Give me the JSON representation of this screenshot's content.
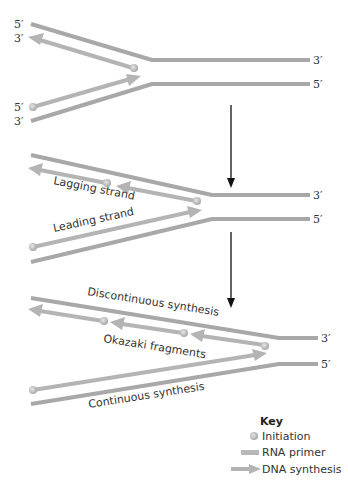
{
  "figure": {
    "panels": [
      {
        "id": "initiation",
        "labels": {
          "top_left_5": "5′",
          "top_left_3": "3′",
          "bottom_left_5": "5′",
          "bottom_left_3": "3′",
          "right_top": "3′",
          "right_bottom": "5′"
        }
      },
      {
        "id": "elongation",
        "labels": {
          "lagging": "Lagging strand",
          "leading": "Leading strand",
          "right_top": "3′",
          "right_bottom": "5′"
        }
      },
      {
        "id": "fragments",
        "labels": {
          "discontinuous": "Discontinuous synthesis",
          "okazaki": "Okazaki fragments",
          "continuous": "Continuous synthesis",
          "right_top": "3′",
          "right_bottom": "5′"
        }
      }
    ],
    "key": {
      "title": "Key",
      "items": [
        {
          "icon": "initiation-dot-icon",
          "label": "Initiation"
        },
        {
          "icon": "rna-primer-bar-icon",
          "label": "RNA primer"
        },
        {
          "icon": "dna-synthesis-arrow-icon",
          "label": "DNA synthesis"
        }
      ]
    },
    "colors": {
      "strand": "#a9a9a9",
      "strand_dark": "#8f8f8f",
      "primer": "#bdbdbd",
      "dot": "#c8c8c8",
      "arrow": "#111111",
      "text": "#333333"
    }
  }
}
